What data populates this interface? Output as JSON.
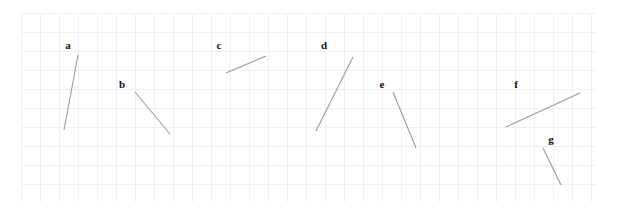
{
  "figure": {
    "background_color": "#ffffff",
    "grid": {
      "line_color": "#eceff3",
      "x_start": 21,
      "y_start": 13,
      "x_end": 596,
      "y_end": 202,
      "spacing": 19,
      "visible": true
    },
    "segment_color": "#9a9a9a",
    "label_color": "#101010"
  },
  "chart_data": {
    "type": "scatter",
    "title": "",
    "xlabel": "",
    "ylabel": "",
    "grid": true,
    "legend": "none",
    "xlim": [
      0,
      617
    ],
    "ylim": [
      215,
      0
    ],
    "segments": [
      {
        "label": "a",
        "x1": 64,
        "y1": 130,
        "x2": 78,
        "y2": 55,
        "label_x": 68,
        "label_y": 49
      },
      {
        "label": "b",
        "x1": 135,
        "y1": 92,
        "x2": 170,
        "y2": 134,
        "label_x": 122,
        "label_y": 88
      },
      {
        "label": "c",
        "x1": 226,
        "y1": 73,
        "x2": 266,
        "y2": 56,
        "label_x": 219,
        "label_y": 49
      },
      {
        "label": "d",
        "x1": 316,
        "y1": 131,
        "x2": 353,
        "y2": 57,
        "label_x": 324,
        "label_y": 49
      },
      {
        "label": "e",
        "x1": 393,
        "y1": 92,
        "x2": 416,
        "y2": 148,
        "label_x": 382,
        "label_y": 88
      },
      {
        "label": "f",
        "x1": 506,
        "y1": 127,
        "x2": 580,
        "y2": 93,
        "label_x": 516,
        "label_y": 88
      },
      {
        "label": "g",
        "x1": 543,
        "y1": 148,
        "x2": 561,
        "y2": 185,
        "label_x": 551,
        "label_y": 143
      }
    ]
  }
}
